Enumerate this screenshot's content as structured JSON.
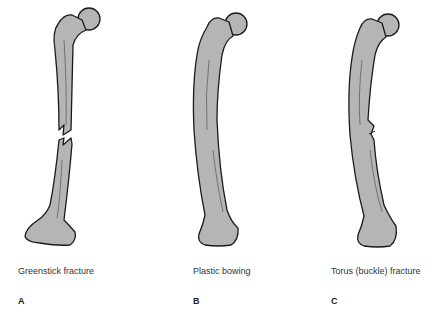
{
  "colors": {
    "bone_fill": "#b5b5b5",
    "bone_outline": "#1a1a1a",
    "background": "#ffffff"
  },
  "panels": [
    {
      "letter": "A",
      "caption": "Greenstick fracture",
      "icon": "femur-greenstick-fracture"
    },
    {
      "letter": "B",
      "caption": "Plastic bowing",
      "icon": "femur-plastic-bowing"
    },
    {
      "letter": "C",
      "caption": "Torus (buckle) fracture",
      "icon": "femur-torus-fracture"
    }
  ]
}
